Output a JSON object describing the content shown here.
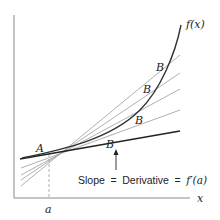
{
  "diagram": {
    "curve_label": "f(x)",
    "point_a_label": "A",
    "secant_point_labels": [
      "B",
      "B",
      "B",
      "B"
    ],
    "x_axis_label": "x",
    "a_tick_label": "a",
    "annotation": {
      "slope": "Slope",
      "eq1": "=",
      "derivative": "Derivative",
      "eq2": "=",
      "formula": "f′(a)"
    },
    "colors": {
      "axis": "#8a8a8a",
      "curve": "#333333",
      "secant": "#9a9a9a",
      "tangent": "#222222",
      "text": "#222222"
    }
  }
}
